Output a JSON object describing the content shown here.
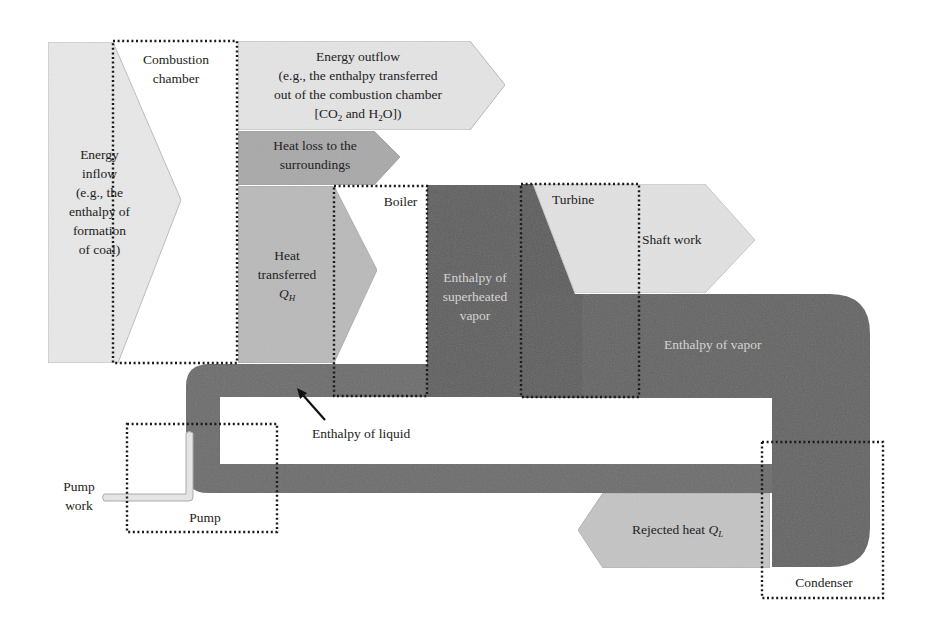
{
  "diagram": {
    "colors": {
      "background": "#ffffff",
      "light_fill": "#e6e6e6",
      "medium_fill": "#b4b4b4",
      "heat_loss_fill": "#a8a8a8",
      "dark_pipe": "#6a6a6a",
      "darker_pipe": "#5e5e5e",
      "dotted_border": "#1a1a1a",
      "text_dark": "#222222",
      "text_light": "#d4d4d4"
    },
    "components": {
      "combustion_chamber": {
        "line1": "Combustion",
        "line2": "chamber"
      },
      "boiler": {
        "label": "Boiler"
      },
      "turbine": {
        "label": "Turbine"
      },
      "pump": {
        "label": "Pump"
      },
      "condenser": {
        "label": "Condenser"
      }
    },
    "flows": {
      "energy_inflow": {
        "lines": [
          "Energy",
          "inflow",
          "(e.g., the",
          "enthalpy of",
          "formation",
          "of coal)"
        ]
      },
      "energy_outflow": {
        "line1": "Energy outflow",
        "line2": "(e.g., the enthalpy transferred",
        "line3": "out of the combustion chamber",
        "line4_a": "[CO",
        "line4_sub1": "2",
        "line4_b": " and H",
        "line4_sub2": "2",
        "line4_c": "O])"
      },
      "heat_loss": {
        "line1": "Heat loss to the",
        "line2": "surroundings"
      },
      "heat_transferred": {
        "line1": "Heat",
        "line2": "transferred",
        "symbol": "Q",
        "subscript": "H"
      },
      "superheated_vapor": {
        "line1": "Enthalpy of",
        "line2": "superheated",
        "line3": "vapor"
      },
      "shaft_work": {
        "label": "Shaft work"
      },
      "vapor": {
        "label": "Enthalpy of vapor"
      },
      "liquid": {
        "label": "Enthalpy of liquid"
      },
      "pump_work": {
        "line1": "Pump",
        "line2": "work"
      },
      "rejected_heat": {
        "label": "Rejected heat ",
        "symbol": "Q",
        "subscript": "L"
      }
    }
  }
}
